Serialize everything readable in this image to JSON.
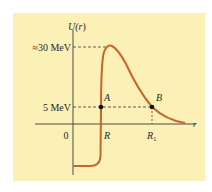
{
  "diagram": {
    "type": "potential-energy-curve",
    "y_axis_label": "U(r)",
    "x_axis_label": "r",
    "origin_label": "0",
    "levels": [
      {
        "label": "≈30 MeV",
        "value_mev": 30
      },
      {
        "label": "5 MeV",
        "value_mev": 5
      }
    ],
    "points": [
      {
        "label": "A",
        "x_label": "R"
      },
      {
        "label": "B",
        "x_label": "R",
        "x_subscript": "1"
      }
    ],
    "colors": {
      "background": "#fbf0b6",
      "curve": "#c8642d",
      "axes": "#3a3a3a",
      "dashed": "#3a3a3a",
      "points": "#111111"
    }
  },
  "labels": {
    "u_prefix": "U(",
    "u_var": "r",
    "u_suffix": ")",
    "level_30": "≈30 MeV",
    "level_5": "5 MeV",
    "origin": "0",
    "r_axis": "r",
    "point_a": "A",
    "point_b": "B",
    "tick_r": "R",
    "tick_r1": "R",
    "tick_r1_sub": "1"
  }
}
